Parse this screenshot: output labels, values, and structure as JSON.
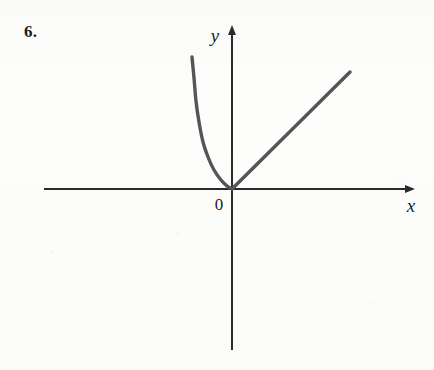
{
  "figure": {
    "problem_number": "6.",
    "background_color": "#fdfdfc",
    "axis_color": "#2b2b2b",
    "curve_color": "#555555",
    "text_color": "#1d1d1d"
  },
  "labels": {
    "y_axis": "y",
    "x_axis": "x",
    "origin": "0"
  },
  "chart_data": {
    "type": "line",
    "title": "",
    "subtitle": "",
    "xlabel": "x",
    "ylabel": "y",
    "grid": false,
    "legend": false,
    "axes": {
      "origin_px": [
        232,
        189
      ],
      "x_axis_span_px": [
        44,
        414
      ],
      "y_axis_span_px": [
        26,
        350
      ],
      "x_arrow": "right",
      "y_arrow": "up",
      "ticks": [],
      "tick_labels": [],
      "origin_label": "0"
    },
    "annotations": [
      {
        "text": "6.",
        "role": "problem-number",
        "px": [
          24,
          22
        ]
      },
      {
        "text": "y",
        "role": "axis-label",
        "px": [
          215,
          42
        ]
      },
      {
        "text": "x",
        "role": "axis-label",
        "px": [
          411,
          211
        ]
      },
      {
        "text": "0",
        "role": "origin-label",
        "px": [
          219,
          205
        ]
      }
    ],
    "series": [
      {
        "name": "left-branch",
        "description": "Steep decreasing convex curve for x < 0 falling to the origin, exponential-like",
        "shape": "curve",
        "points_px": [
          [
            192,
            57
          ],
          [
            194,
            78
          ],
          [
            196,
            101
          ],
          [
            199,
            122
          ],
          [
            203,
            142
          ],
          [
            208,
            157
          ],
          [
            214,
            170
          ],
          [
            221,
            180
          ],
          [
            227,
            186
          ],
          [
            232,
            189
          ]
        ]
      },
      {
        "name": "right-branch",
        "description": "Straight ray of positive slope for x > 0 starting at the origin",
        "shape": "line",
        "points_px": [
          [
            232,
            189
          ],
          [
            350,
            72
          ]
        ]
      }
    ]
  }
}
